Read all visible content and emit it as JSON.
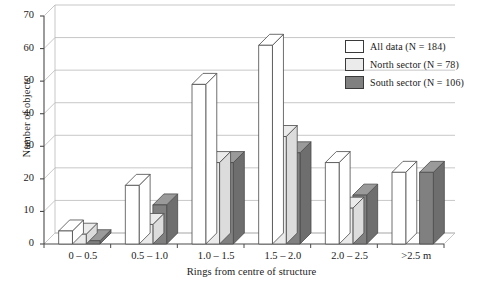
{
  "chart_data": {
    "type": "bar",
    "title": "",
    "xlabel": "Rings from centre of structure",
    "ylabel": "Number of objects",
    "categories": [
      "0 – 0.5",
      "0.5 – 1.0",
      "1.0 – 1.5",
      "1.5 – 2.0",
      "2.0 – 2.5",
      ">2.5 m"
    ],
    "ylim": [
      0,
      70
    ],
    "yticks": [
      0,
      10,
      20,
      30,
      40,
      50,
      60,
      70
    ],
    "grid": true,
    "legend_position": "upper-right",
    "style": "3d-bar",
    "series": [
      {
        "name": "All data (N = 184)",
        "color": "#ffffff",
        "values": [
          4,
          18,
          49,
          61,
          25,
          22
        ]
      },
      {
        "name": "North sector (N = 78)",
        "color": "#ebebeb",
        "values": [
          3,
          6,
          25,
          33,
          11,
          0
        ]
      },
      {
        "name": "South sector (N = 106)",
        "color": "#808080",
        "values": [
          1,
          12,
          25,
          28,
          15,
          22
        ]
      }
    ]
  },
  "legend": {
    "items": [
      {
        "label": "All data (N = 184)",
        "color": "#ffffff"
      },
      {
        "label": "North sector (N = 78)",
        "color": "#ebebeb"
      },
      {
        "label": "South sector (N = 106)",
        "color": "#808080"
      }
    ]
  },
  "axes": {
    "y_title": "Number of objects",
    "x_title": "Rings from centre of structure",
    "y_ticks": [
      "0",
      "10",
      "20",
      "30",
      "40",
      "50",
      "60",
      "70"
    ],
    "x_ticks": [
      "0 – 0.5",
      "0.5 – 1.0",
      "1.0 – 1.5",
      "1.5 – 2.0",
      "2.0 – 2.5",
      ">2.5 m"
    ]
  },
  "colors": {
    "axis": "#4a4a4a",
    "grid": "#b9b9b9",
    "bar_edge": "#4a4a4a",
    "all_data": "#ffffff",
    "north_sector": "#ebebeb",
    "south_sector": "#808080",
    "background": "#ffffff"
  }
}
